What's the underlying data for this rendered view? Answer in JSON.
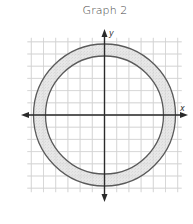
{
  "title": "Graph 2",
  "chart_data": {
    "type": "diagram",
    "title": "Graph 2",
    "xlabel": "x",
    "ylabel": "y",
    "grid": true,
    "grid_range": [
      -6,
      6
    ],
    "shapes": [
      {
        "kind": "circle",
        "center": [
          0,
          0
        ],
        "radius": 5.8,
        "role": "outer"
      },
      {
        "kind": "circle",
        "center": [
          0,
          0
        ],
        "radius": 4.8,
        "role": "inner"
      }
    ],
    "shaded_region": "between inner and outer circles"
  },
  "axes": {
    "x_label": "x",
    "y_label": "y"
  },
  "colors": {
    "grid": "#d4d4d4",
    "axis": "#2a2a2a",
    "circle_stroke": "#5a5a5a",
    "ring_fill": "#e4e4e4"
  }
}
